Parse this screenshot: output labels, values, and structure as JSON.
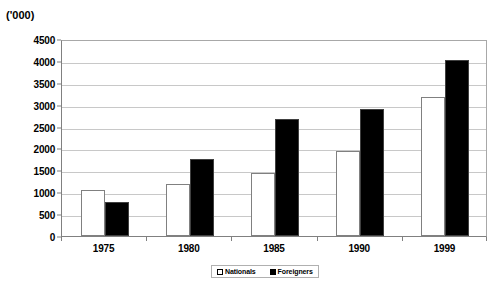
{
  "chart_data": {
    "type": "bar",
    "title": "",
    "units_label": "('000)",
    "xlabel": "",
    "ylabel": "",
    "categories": [
      "1975",
      "1980",
      "1985",
      "1990",
      "1999"
    ],
    "series": [
      {
        "name": "Nationals",
        "values": [
          1040,
          1180,
          1450,
          1950,
          3180
        ],
        "color": "#ffffff"
      },
      {
        "name": "Foreigners",
        "values": [
          780,
          1760,
          2670,
          2900,
          4030
        ],
        "color": "#000000"
      }
    ],
    "ylim": [
      0,
      4500
    ],
    "ytick_step": 500,
    "yticks": [
      0,
      500,
      1000,
      1500,
      2000,
      2500,
      3000,
      3500,
      4000,
      4500
    ],
    "ytick_labels": [
      "0",
      "500",
      "1000",
      "1500",
      "2000",
      "2500",
      "3000",
      "3500",
      "4000",
      "4500"
    ],
    "grid": true,
    "grid_axis": "y",
    "legend_position": "bottom-center"
  },
  "legend": {
    "items": [
      {
        "label": "Nationals",
        "swatch": "hollow-square"
      },
      {
        "label": "Foreigners",
        "swatch": "solid-square"
      }
    ]
  }
}
